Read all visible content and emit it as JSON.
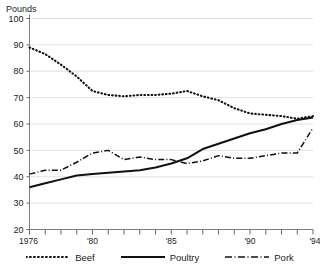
{
  "chart_title": "PER CAPITA CONSUMPTION OF MEAT",
  "axis_unit": "Pounds",
  "legend": {
    "items": [
      {
        "label": "Beef",
        "style": "dotted",
        "swatch": "dotted-line-icon"
      },
      {
        "label": "Poultry",
        "style": "solid",
        "swatch": "solid-line-icon"
      },
      {
        "label": "Pork",
        "style": "dash-dot",
        "swatch": "dash-dot-line-icon"
      }
    ]
  },
  "chart_data": {
    "type": "line",
    "title": "PER CAPITA CONSUMPTION OF MEAT",
    "xlabel": "",
    "ylabel": "Pounds",
    "ylim": [
      20,
      100
    ],
    "xlim": [
      1976,
      1994
    ],
    "yticks": [
      20,
      30,
      40,
      50,
      60,
      70,
      80,
      90,
      100
    ],
    "xticks": [
      1976,
      1977,
      1978,
      1979,
      1980,
      1981,
      1982,
      1983,
      1984,
      1985,
      1986,
      1987,
      1988,
      1989,
      1990,
      1991,
      1992,
      1993,
      1994
    ],
    "xtick_labels": [
      "1976",
      "",
      "",
      "",
      "'80",
      "",
      "",
      "",
      "",
      "'85",
      "",
      "",
      "",
      "",
      "'90",
      "",
      "",
      "",
      "'94"
    ],
    "grid": "horizontal",
    "legend_position": "bottom",
    "x": [
      1976,
      1977,
      1978,
      1979,
      1980,
      1981,
      1982,
      1983,
      1984,
      1985,
      1986,
      1987,
      1988,
      1989,
      1990,
      1991,
      1992,
      1993,
      1994
    ],
    "series": [
      {
        "name": "Beef",
        "style": "dotted",
        "values": [
          89.0,
          86.5,
          82.5,
          78.0,
          72.5,
          71.0,
          70.5,
          71.0,
          71.0,
          71.5,
          72.5,
          70.5,
          69.0,
          66.0,
          64.0,
          63.5,
          63.0,
          62.0,
          63.0
        ]
      },
      {
        "name": "Poultry",
        "style": "solid",
        "values": [
          36.0,
          37.5,
          39.0,
          40.5,
          41.0,
          41.5,
          42.0,
          42.5,
          43.5,
          45.0,
          47.0,
          50.5,
          52.5,
          54.5,
          56.5,
          58.0,
          60.0,
          61.5,
          62.5
        ]
      },
      {
        "name": "Pork",
        "style": "dash-dot",
        "values": [
          41.0,
          42.5,
          42.5,
          45.5,
          49.0,
          50.0,
          46.5,
          47.5,
          46.5,
          46.5,
          45.0,
          46.0,
          48.0,
          47.0,
          47.0,
          48.0,
          49.0,
          49.0,
          58.5
        ]
      }
    ]
  }
}
